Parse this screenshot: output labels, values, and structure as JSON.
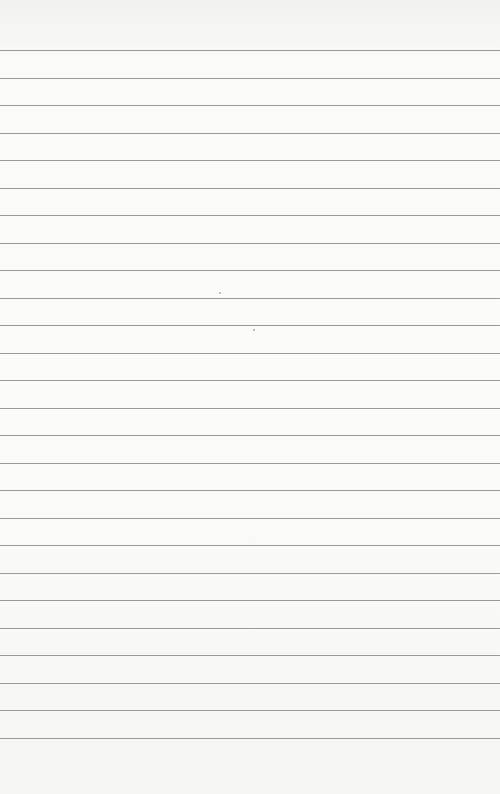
{
  "page": {
    "type": "lined-paper",
    "background_color": "#f8f8f6",
    "line_color": "#9a9a9a",
    "line_count": 26,
    "first_line_y": 50,
    "line_spacing": 27.5
  }
}
